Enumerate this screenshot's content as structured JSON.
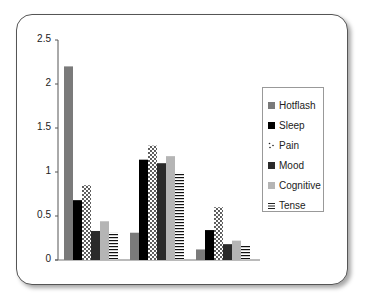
{
  "chart_data": {
    "type": "bar",
    "title": "",
    "xlabel": "",
    "ylabel": "",
    "categories": [
      "",
      "",
      ""
    ],
    "ylim": [
      0,
      2.5
    ],
    "yticks": [
      "0",
      "0.5",
      "1",
      "1.5",
      "2",
      "2.5"
    ],
    "grid": false,
    "legend_position": "right",
    "series": [
      {
        "name": "Hotflash",
        "values": [
          2.2,
          0.31,
          0.12
        ],
        "pattern": "solid",
        "color": "#7a7a7a"
      },
      {
        "name": "Sleep",
        "values": [
          0.68,
          1.14,
          0.34
        ],
        "pattern": "solid",
        "color": "#000000"
      },
      {
        "name": "Pain",
        "values": [
          0.85,
          1.3,
          0.6
        ],
        "pattern": "dots",
        "color": "#ffffff"
      },
      {
        "name": "Mood",
        "values": [
          0.33,
          1.1,
          0.18
        ],
        "pattern": "solid",
        "color": "#2a2a2a"
      },
      {
        "name": "Cognitive",
        "values": [
          0.44,
          1.18,
          0.22
        ],
        "pattern": "solid",
        "color": "#b5b5b5"
      },
      {
        "name": "Tense",
        "values": [
          0.31,
          0.99,
          0.16
        ],
        "pattern": "horizontal-lines",
        "color": "#ffffff"
      }
    ]
  },
  "legend": {
    "items": [
      "Hotflash",
      "Sleep",
      "Pain",
      "Mood",
      "Cognitive",
      "Tense"
    ]
  },
  "axis": {
    "y_labels": [
      "2.5",
      "2",
      "1.5",
      "1",
      "0.5",
      "0"
    ]
  }
}
